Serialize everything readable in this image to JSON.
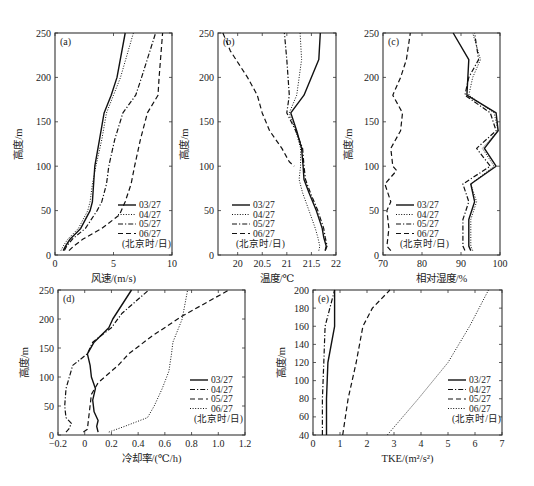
{
  "legend_note": "(北京时/日)",
  "chart_data": [
    {
      "panel": "(a)",
      "type": "line",
      "xlabel": "风速/(m/s)",
      "ylabel": "高度/m",
      "xlim": [
        0,
        10
      ],
      "ylim": [
        0,
        250
      ],
      "xticks": [
        0,
        5,
        10
      ],
      "yticks": [
        0,
        50,
        100,
        150,
        200,
        250
      ],
      "legend_position": "lower right",
      "series": [
        {
          "name": "03/27",
          "style": "solid",
          "points": [
            [
              0.7,
              5
            ],
            [
              0.9,
              10
            ],
            [
              1.3,
              18
            ],
            [
              2.2,
              30
            ],
            [
              3.0,
              50
            ],
            [
              3.2,
              60
            ],
            [
              3.3,
              80
            ],
            [
              3.4,
              100
            ],
            [
              3.8,
              130
            ],
            [
              4.2,
              160
            ],
            [
              4.8,
              180
            ],
            [
              5.3,
              200
            ],
            [
              6.0,
              250
            ]
          ]
        },
        {
          "name": "04/27",
          "style": "dotted",
          "points": [
            [
              0.5,
              5
            ],
            [
              0.7,
              10
            ],
            [
              1.1,
              18
            ],
            [
              2.0,
              30
            ],
            [
              2.8,
              50
            ],
            [
              3.0,
              60
            ],
            [
              3.2,
              80
            ],
            [
              3.5,
              100
            ],
            [
              4.0,
              130
            ],
            [
              4.4,
              160
            ],
            [
              5.0,
              180
            ],
            [
              5.6,
              200
            ],
            [
              6.7,
              250
            ]
          ]
        },
        {
          "name": "05/27",
          "style": "dashdot",
          "points": [
            [
              0.8,
              5
            ],
            [
              1.0,
              10
            ],
            [
              1.5,
              18
            ],
            [
              2.6,
              30
            ],
            [
              3.6,
              50
            ],
            [
              4.0,
              60
            ],
            [
              4.4,
              80
            ],
            [
              4.6,
              100
            ],
            [
              5.1,
              130
            ],
            [
              5.8,
              160
            ],
            [
              6.9,
              180
            ],
            [
              7.4,
              200
            ],
            [
              8.6,
              250
            ]
          ]
        },
        {
          "name": "06/27",
          "style": "dashed",
          "points": [
            [
              1.2,
              5
            ],
            [
              1.6,
              10
            ],
            [
              2.4,
              18
            ],
            [
              4.0,
              30
            ],
            [
              5.5,
              45
            ],
            [
              6.0,
              60
            ],
            [
              6.5,
              80
            ],
            [
              6.8,
              100
            ],
            [
              7.3,
              130
            ],
            [
              7.9,
              160
            ],
            [
              8.8,
              180
            ],
            [
              8.9,
              200
            ],
            [
              9.2,
              250
            ]
          ]
        }
      ]
    },
    {
      "panel": "(b)",
      "type": "line",
      "xlabel": "温度/℃",
      "ylabel": "高度/m",
      "xlim": [
        19.6,
        22
      ],
      "ylim": [
        0,
        250
      ],
      "xticks": [
        20,
        20.5,
        21,
        21.5,
        22
      ],
      "yticks": [
        0,
        50,
        100,
        150,
        200,
        250
      ],
      "legend_position": "lower left",
      "series": [
        {
          "name": "03/27",
          "style": "solid",
          "points": [
            [
              21.78,
              5
            ],
            [
              21.8,
              10
            ],
            [
              21.75,
              20
            ],
            [
              21.72,
              30
            ],
            [
              21.6,
              50
            ],
            [
              21.45,
              70
            ],
            [
              21.35,
              85
            ],
            [
              21.33,
              100
            ],
            [
              21.3,
              120
            ],
            [
              21.2,
              140
            ],
            [
              21.08,
              160
            ],
            [
              21.35,
              180
            ],
            [
              21.65,
              220
            ],
            [
              21.68,
              250
            ]
          ]
        },
        {
          "name": "04/27",
          "style": "dotted",
          "points": [
            [
              21.65,
              5
            ],
            [
              21.67,
              10
            ],
            [
              21.63,
              20
            ],
            [
              21.58,
              30
            ],
            [
              21.45,
              50
            ],
            [
              21.32,
              70
            ],
            [
              21.25,
              85
            ],
            [
              21.28,
              100
            ],
            [
              21.28,
              120
            ],
            [
              21.18,
              140
            ],
            [
              21.05,
              160
            ],
            [
              21.2,
              180
            ],
            [
              21.3,
              220
            ],
            [
              21.27,
              250
            ]
          ]
        },
        {
          "name": "05/27",
          "style": "dashdot",
          "points": [
            [
              21.78,
              5
            ],
            [
              21.82,
              10
            ],
            [
              21.78,
              20
            ],
            [
              21.75,
              30
            ],
            [
              21.63,
              50
            ],
            [
              21.48,
              70
            ],
            [
              21.38,
              85
            ],
            [
              21.35,
              100
            ],
            [
              21.32,
              120
            ],
            [
              21.18,
              140
            ],
            [
              21.0,
              160
            ],
            [
              21.05,
              180
            ],
            [
              21.0,
              220
            ],
            [
              20.95,
              250
            ]
          ]
        },
        {
          "name": "06/27",
          "style": "dashed",
          "points": [
            [
              19.7,
              250
            ],
            [
              19.85,
              230
            ],
            [
              20.2,
              200
            ],
            [
              20.4,
              180
            ],
            [
              20.5,
              160
            ],
            [
              20.65,
              140
            ],
            [
              20.9,
              120
            ],
            [
              21.05,
              105
            ],
            [
              21.15,
              100
            ]
          ]
        }
      ]
    },
    {
      "panel": "(c)",
      "type": "line",
      "xlabel": "相对湿度/%",
      "ylabel": "高度/m",
      "xlim": [
        70,
        100
      ],
      "ylim": [
        0,
        250
      ],
      "xticks": [
        70,
        80,
        90,
        100
      ],
      "yticks": [
        0,
        50,
        100,
        150,
        200,
        250
      ],
      "legend_position": "lower left",
      "series": [
        {
          "name": "03/27",
          "style": "solid",
          "points": [
            [
              92.5,
              5
            ],
            [
              92,
              10
            ],
            [
              92,
              40
            ],
            [
              93.5,
              60
            ],
            [
              92.5,
              80
            ],
            [
              99,
              100
            ],
            [
              96,
              120
            ],
            [
              99.5,
              140
            ],
            [
              99,
              160
            ],
            [
              91.5,
              180
            ],
            [
              92,
              220
            ],
            [
              88,
              250
            ]
          ]
        },
        {
          "name": "04/27",
          "style": "dotted",
          "points": [
            [
              93,
              5
            ],
            [
              92.5,
              10
            ],
            [
              92.5,
              40
            ],
            [
              94,
              60
            ],
            [
              92.5,
              80
            ],
            [
              98.5,
              100
            ],
            [
              95.5,
              120
            ],
            [
              99.5,
              140
            ],
            [
              98.5,
              160
            ],
            [
              92,
              180
            ],
            [
              93,
              200
            ],
            [
              95,
              220
            ],
            [
              93,
              250
            ]
          ]
        },
        {
          "name": "05/27",
          "style": "dashdot",
          "points": [
            [
              91,
              5
            ],
            [
              90.5,
              10
            ],
            [
              90.5,
              40
            ],
            [
              92,
              60
            ],
            [
              90.5,
              80
            ],
            [
              97.5,
              100
            ],
            [
              94,
              120
            ],
            [
              99,
              140
            ],
            [
              97.5,
              160
            ],
            [
              91,
              180
            ],
            [
              92,
              200
            ],
            [
              94.5,
              220
            ],
            [
              93.5,
              250
            ]
          ]
        },
        {
          "name": "06/27",
          "style": "dashed",
          "points": [
            [
              72,
              5
            ],
            [
              71,
              10
            ],
            [
              71.5,
              30
            ],
            [
              71,
              50
            ],
            [
              72,
              60
            ],
            [
              70.5,
              80
            ],
            [
              73.5,
              95
            ],
            [
              72.5,
              100
            ],
            [
              72,
              120
            ],
            [
              74.5,
              140
            ],
            [
              75,
              160
            ],
            [
              72.5,
              180
            ],
            [
              74.5,
              200
            ],
            [
              76,
              220
            ],
            [
              77,
              250
            ]
          ]
        }
      ]
    },
    {
      "panel": "(d)",
      "type": "line",
      "xlabel": "冷却率/(℃/h)",
      "ylabel": "高度/m",
      "xlim": [
        -0.2,
        1.2
      ],
      "ylim": [
        0,
        250
      ],
      "xticks": [
        -0.2,
        0,
        0.2,
        0.4,
        0.6,
        0.8,
        1.0,
        1.2
      ],
      "yticks": [
        0,
        50,
        100,
        150,
        200,
        250
      ],
      "legend_position": "lower right",
      "series": [
        {
          "name": "03/27",
          "style": "solid",
          "points": [
            [
              0.1,
              5
            ],
            [
              0.09,
              15
            ],
            [
              0.1,
              25
            ],
            [
              0.07,
              40
            ],
            [
              0.06,
              60
            ],
            [
              0.08,
              80
            ],
            [
              0.05,
              100
            ],
            [
              0.04,
              120
            ],
            [
              0.02,
              140
            ],
            [
              0.07,
              160
            ],
            [
              0.18,
              185
            ],
            [
              0.21,
              200
            ],
            [
              0.35,
              250
            ]
          ]
        },
        {
          "name": "04/27",
          "style": "dashdot",
          "points": [
            [
              -0.14,
              5
            ],
            [
              -0.12,
              10
            ],
            [
              -0.1,
              20
            ],
            [
              -0.14,
              30
            ],
            [
              -0.15,
              50
            ],
            [
              -0.14,
              80
            ],
            [
              -0.09,
              120
            ],
            [
              0.02,
              140
            ],
            [
              0.06,
              160
            ],
            [
              0.2,
              185
            ],
            [
              0.28,
              210
            ],
            [
              0.48,
              250
            ]
          ]
        },
        {
          "name": "05/27",
          "style": "dashed",
          "points": [
            [
              -0.01,
              5
            ],
            [
              0.02,
              10
            ],
            [
              0.03,
              30
            ],
            [
              0.05,
              70
            ],
            [
              0.1,
              90
            ],
            [
              0.25,
              120
            ],
            [
              0.33,
              140
            ],
            [
              0.5,
              170
            ],
            [
              0.73,
              205
            ],
            [
              1.08,
              250
            ]
          ]
        },
        {
          "name": "06/27",
          "style": "dotted",
          "points": [
            [
              0.18,
              5
            ],
            [
              0.3,
              15
            ],
            [
              0.47,
              30
            ],
            [
              0.52,
              50
            ],
            [
              0.58,
              80
            ],
            [
              0.63,
              110
            ],
            [
              0.65,
              140
            ],
            [
              0.66,
              160
            ],
            [
              0.73,
              200
            ],
            [
              0.77,
              250
            ]
          ]
        }
      ]
    },
    {
      "panel": "(e)",
      "type": "line",
      "xlabel": "TKE/(m²/s²)",
      "ylabel": "高度/m",
      "xlim": [
        0,
        7
      ],
      "ylim": [
        40,
        200
      ],
      "xticks": [
        0,
        1,
        2,
        3,
        4,
        5,
        6,
        7
      ],
      "yticks": [
        40,
        60,
        80,
        100,
        120,
        140,
        160,
        180,
        200
      ],
      "legend_position": "lower right",
      "series": [
        {
          "name": "03/27",
          "style": "solid",
          "points": [
            [
              0.5,
              40
            ],
            [
              0.5,
              80
            ],
            [
              0.55,
              120
            ],
            [
              0.8,
              160
            ],
            [
              0.8,
              200
            ]
          ]
        },
        {
          "name": "04/27",
          "style": "dashdot",
          "points": [
            [
              0.35,
              40
            ],
            [
              0.35,
              80
            ],
            [
              0.4,
              120
            ],
            [
              0.45,
              160
            ],
            [
              0.8,
              200
            ]
          ]
        },
        {
          "name": "05/27",
          "style": "dashed",
          "points": [
            [
              1.1,
              40
            ],
            [
              1.3,
              80
            ],
            [
              1.6,
              120
            ],
            [
              1.85,
              160
            ],
            [
              2.2,
              180
            ],
            [
              2.85,
              200
            ]
          ]
        },
        {
          "name": "06/27",
          "style": "dotted",
          "points": [
            [
              2.75,
              40
            ],
            [
              3.9,
              80
            ],
            [
              5.0,
              120
            ],
            [
              5.8,
              160
            ],
            [
              6.5,
              200
            ]
          ]
        }
      ]
    }
  ]
}
